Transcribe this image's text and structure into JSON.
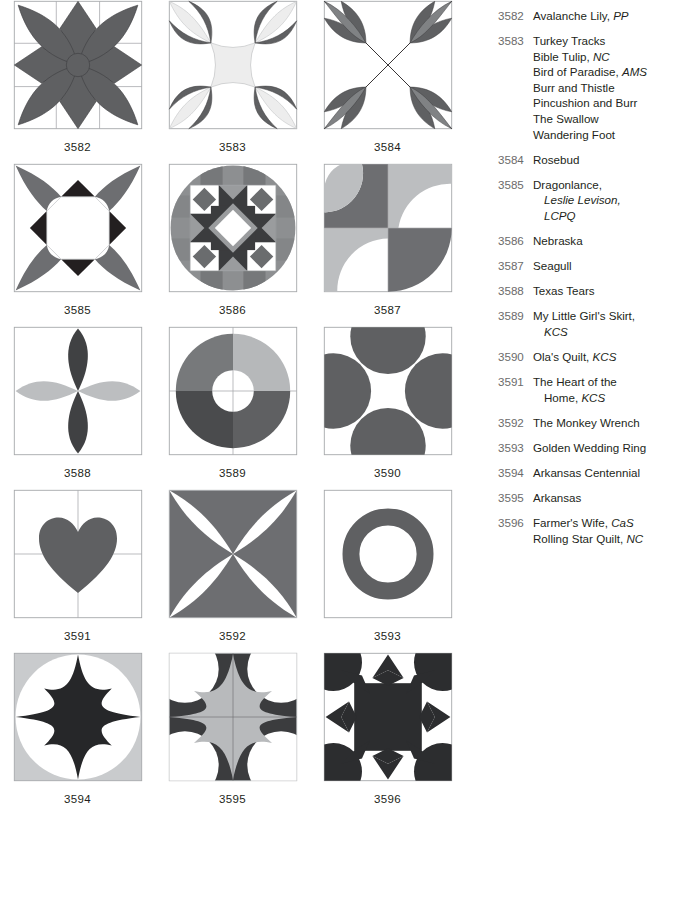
{
  "blocks": [
    {
      "id": "3582",
      "label": "3582",
      "pattern": "flower-eight-point"
    },
    {
      "id": "3583",
      "label": "3583",
      "pattern": "turkey-tracks"
    },
    {
      "id": "3584",
      "label": "3584",
      "pattern": "rosebud"
    },
    {
      "id": "3585",
      "label": "3585",
      "pattern": "dragonlance"
    },
    {
      "id": "3586",
      "label": "3586",
      "pattern": "nebraska"
    },
    {
      "id": "3587",
      "label": "3587",
      "pattern": "seagull"
    },
    {
      "id": "3588",
      "label": "3588",
      "pattern": "texas-tears"
    },
    {
      "id": "3589",
      "label": "3589",
      "pattern": "my-little-girls-skirt"
    },
    {
      "id": "3590",
      "label": "3590",
      "pattern": "olas-quilt"
    },
    {
      "id": "3591",
      "label": "3591",
      "pattern": "heart-of-the-home"
    },
    {
      "id": "3592",
      "label": "3592",
      "pattern": "monkey-wrench"
    },
    {
      "id": "3593",
      "label": "3593",
      "pattern": "golden-wedding-ring"
    },
    {
      "id": "3594",
      "label": "3594",
      "pattern": "arkansas-centennial"
    },
    {
      "id": "3595",
      "label": "3595",
      "pattern": "arkansas"
    },
    {
      "id": "3596",
      "label": "3596",
      "pattern": "farmers-wife"
    }
  ],
  "index": [
    {
      "number": "3582",
      "lines": [
        {
          "text": "Avalanche Lily, ",
          "src": "PP",
          "indent": false
        }
      ]
    },
    {
      "number": "3583",
      "lines": [
        {
          "text": "Turkey Tracks",
          "src": "",
          "indent": false
        },
        {
          "text": "Bible Tulip, ",
          "src": "NC",
          "indent": false
        },
        {
          "text": "Bird of Paradise, ",
          "src": "AMS",
          "indent": false
        },
        {
          "text": "Burr and Thistle",
          "src": "",
          "indent": false
        },
        {
          "text": "Pincushion and Burr",
          "src": "",
          "indent": false
        },
        {
          "text": "The Swallow",
          "src": "",
          "indent": false
        },
        {
          "text": "Wandering Foot",
          "src": "",
          "indent": false
        }
      ]
    },
    {
      "number": "3584",
      "lines": [
        {
          "text": "Rosebud",
          "src": "",
          "indent": false
        }
      ]
    },
    {
      "number": "3585",
      "lines": [
        {
          "text": "Dragonlance,",
          "src": "",
          "indent": false
        },
        {
          "text": "",
          "src": "Leslie Levison,",
          "indent": true
        },
        {
          "text": "",
          "src": "LCPQ",
          "indent": true
        }
      ]
    },
    {
      "number": "3586",
      "lines": [
        {
          "text": "Nebraska",
          "src": "",
          "indent": false
        }
      ]
    },
    {
      "number": "3587",
      "lines": [
        {
          "text": "Seagull",
          "src": "",
          "indent": false
        }
      ]
    },
    {
      "number": "3588",
      "lines": [
        {
          "text": "Texas Tears",
          "src": "",
          "indent": false
        }
      ]
    },
    {
      "number": "3589",
      "lines": [
        {
          "text": "My Little Girl's Skirt,",
          "src": "",
          "indent": false
        },
        {
          "text": "",
          "src": "KCS",
          "indent": true
        }
      ]
    },
    {
      "number": "3590",
      "lines": [
        {
          "text": "Ola's Quilt, ",
          "src": "KCS",
          "indent": false
        }
      ]
    },
    {
      "number": "3591",
      "lines": [
        {
          "text": "The Heart of the",
          "src": "",
          "indent": false
        },
        {
          "text": "Home, ",
          "src": "KCS",
          "indent": true
        }
      ]
    },
    {
      "number": "3592",
      "lines": [
        {
          "text": "The Monkey Wrench",
          "src": "",
          "indent": false
        }
      ]
    },
    {
      "number": "3593",
      "lines": [
        {
          "text": "Golden Wedding Ring",
          "src": "",
          "indent": false
        }
      ]
    },
    {
      "number": "3594",
      "lines": [
        {
          "text": "Arkansas Centennial",
          "src": "",
          "indent": false
        }
      ]
    },
    {
      "number": "3595",
      "lines": [
        {
          "text": "Arkansas",
          "src": "",
          "indent": false
        }
      ]
    },
    {
      "number": "3596",
      "lines": [
        {
          "text": "Farmer's Wife, ",
          "src": "CaS",
          "indent": false
        },
        {
          "text": "Rolling Star Quilt, ",
          "src": "NC",
          "indent": false
        }
      ]
    }
  ],
  "colors": {
    "dark_gray": "#5f6062",
    "medium_gray": "#808284",
    "light_gray": "#bcbec0",
    "pale_gray": "#e6e7e8",
    "near_black": "#231f20",
    "white": "#ffffff",
    "outline": "#a7a9ac",
    "number_text": "#6b6b6b",
    "name_text": "#231f20"
  }
}
